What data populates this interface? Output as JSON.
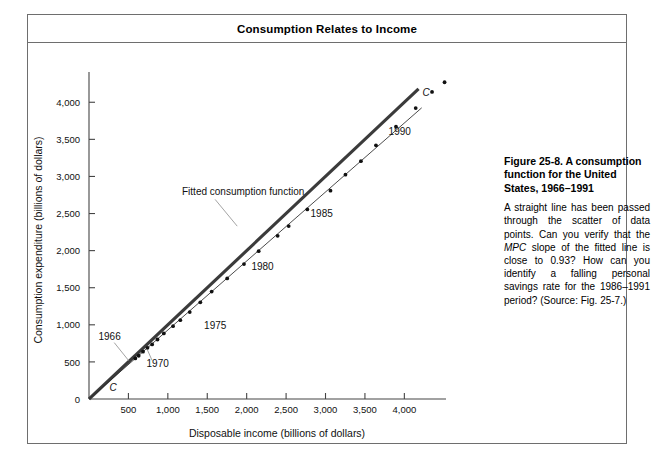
{
  "header": {
    "title": "Consumption Relates to Income"
  },
  "caption": {
    "title": "Figure 25-8.  A consumption function for the United States, 1966–1991",
    "body_before_mpc": "A straight line has been passed through the scatter of data points. Can you verify that the ",
    "mpc": "MPC",
    "body_after_mpc": " slope of the fitted line is close to 0.93? How can you identify a falling personal savings rate for the 1986–1991 period? (Source: Fig. 25-7.)"
  },
  "chart_data": {
    "type": "scatter",
    "title": "Consumption Relates to Income",
    "xlabel": "Disposable income (billions of dollars)",
    "ylabel": "Consumption expenditure (billions of dollars)",
    "xlim": [
      0,
      4300
    ],
    "ylim": [
      0,
      4300
    ],
    "xticks": [
      0,
      500,
      1000,
      1500,
      2000,
      2500,
      3000,
      3500,
      4000
    ],
    "xtick_labels": [
      "",
      "500",
      "1,000",
      "1,500",
      "2,000",
      "2,500",
      "3,000",
      "3,500",
      "4,000"
    ],
    "yticks": [
      0,
      500,
      1000,
      1500,
      2000,
      2500,
      3000,
      3500,
      4000
    ],
    "ytick_labels": [
      "0",
      "500",
      "1,000",
      "1,500",
      "2,000",
      "2,500",
      "3,000",
      "3,500",
      "4,000"
    ],
    "grid": false,
    "legend": "none",
    "series": [
      {
        "name": "45-degree line",
        "type": "line",
        "style": "thick",
        "color": "#3b3b3b",
        "x": [
          0,
          4180
        ],
        "y": [
          0,
          4180
        ]
      },
      {
        "name": "Fitted consumption function",
        "type": "line",
        "style": "thin",
        "color": "#2a2a2a",
        "slope": 0.93,
        "intercept": 0,
        "x": [
          0,
          4220
        ],
        "y": [
          0,
          3925
        ]
      },
      {
        "name": "Annual observations 1966-1991",
        "type": "scatter",
        "color": "#111111",
        "point_labels": [
          "1966",
          "1967",
          "1968",
          "1969",
          "1970",
          "1971",
          "1972",
          "1973",
          "1974",
          "1975",
          "1976",
          "1977",
          "1978",
          "1979",
          "1980",
          "1981",
          "1982",
          "1983",
          "1984",
          "1985",
          "1986",
          "1987",
          "1988",
          "1989",
          "1990",
          "1991"
        ],
        "x": [
          587,
          630,
          685,
          742,
          801,
          869,
          949,
          1066,
          1158,
          1278,
          1412,
          1556,
          1753,
          1966,
          2152,
          2393,
          2533,
          2769,
          3063,
          3253,
          3449,
          3640,
          3894,
          4144,
          4351,
          4510
        ],
        "y": [
          547,
          583,
          638,
          690,
          735,
          802,
          884,
          982,
          1063,
          1172,
          1303,
          1448,
          1625,
          1819,
          1993,
          2200,
          2331,
          2556,
          2808,
          3024,
          3206,
          3419,
          3670,
          3921,
          4139,
          4270
        ]
      }
    ],
    "annotations": [
      {
        "name": "fitted-function-label",
        "text": "Fitted consumption function",
        "x": 1180,
        "y": 2750
      },
      {
        "name": "year-1966-label",
        "text": "1966",
        "x": 120,
        "y": 800
      },
      {
        "name": "year-1970-label",
        "text": "1970",
        "x": 730,
        "y": 430
      },
      {
        "name": "year-1975-label",
        "text": "1975",
        "x": 1460,
        "y": 940
      },
      {
        "name": "year-1980-label",
        "text": "1980",
        "x": 2060,
        "y": 1740
      },
      {
        "name": "year-1985-label",
        "text": "1985",
        "x": 2810,
        "y": 2450
      },
      {
        "name": "year-1990-label",
        "text": "1990",
        "x": 3800,
        "y": 3560
      },
      {
        "name": "curve-label-origin",
        "text": "C",
        "x": 260,
        "y": 105
      },
      {
        "name": "curve-label-end",
        "text": "C",
        "x": 4230,
        "y": 4090
      }
    ]
  }
}
